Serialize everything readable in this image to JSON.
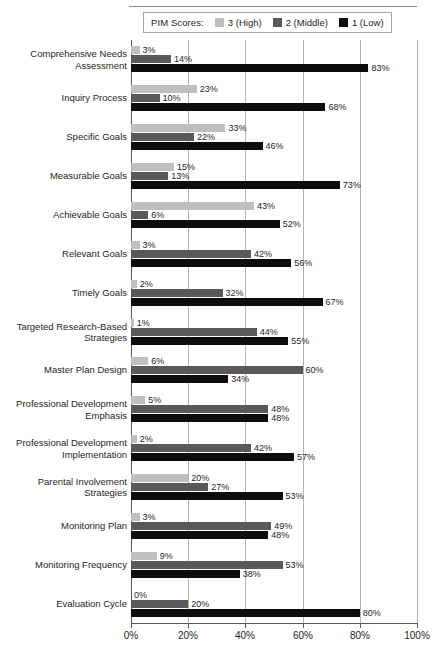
{
  "legend": {
    "title": "PIM Scores:",
    "items": [
      {
        "label": "3 (High)",
        "color": "#bfbfbf",
        "series": "3"
      },
      {
        "label": "2 (Middle)",
        "color": "#58595b",
        "series": "2"
      },
      {
        "label": "1 (Low)",
        "color": "#0d0d0d",
        "series": "1"
      }
    ]
  },
  "chart_data": {
    "type": "bar",
    "orientation": "horizontal",
    "title": "",
    "xlabel": "",
    "ylabel": "",
    "xlim": [
      0,
      100
    ],
    "xticks": [
      "0%",
      "20%",
      "40%",
      "60%",
      "80%",
      "100%"
    ],
    "xtick_values": [
      0,
      20,
      40,
      60,
      80,
      100
    ],
    "grid": true,
    "legend_position": "top",
    "value_suffix": "%",
    "categories": [
      "Comprehensive Needs\nAssessment",
      "Inquiry Process",
      "Specific Goals",
      "Measurable Goals",
      "Achievable Goals",
      "Relevant Goals",
      "Timely Goals",
      "Targeted Research-Based\nStrategies",
      "Master Plan Design",
      "Professional Development\nEmphasis",
      "Professional Development\nImplementation",
      "Parental Involvement\nStrategies",
      "Monitoring Plan",
      "Monitoring Frequency",
      "Evaluation Cycle"
    ],
    "series": [
      {
        "name": "3 (High)",
        "color": "#bfbfbf",
        "values": [
          3,
          23,
          33,
          15,
          43,
          3,
          2,
          1,
          6,
          5,
          2,
          20,
          3,
          9,
          0
        ],
        "labels": [
          "3%",
          "23%",
          "33%",
          "15%",
          "43%",
          "3%",
          "2%",
          "1%",
          "6%",
          "5%",
          "2%",
          "20%",
          "3%",
          "9%",
          "0%"
        ]
      },
      {
        "name": "2 (Middle)",
        "color": "#58595b",
        "values": [
          14,
          10,
          22,
          13,
          6,
          42,
          32,
          44,
          60,
          48,
          42,
          27,
          49,
          53,
          20
        ],
        "labels": [
          "14%",
          "10%",
          "22%",
          "13%",
          "6%",
          "42%",
          "32%",
          "44%",
          "60%",
          "48%",
          "42%",
          "27%",
          "49%",
          "53%",
          "20%"
        ]
      },
      {
        "name": "1 (Low)",
        "color": "#0d0d0d",
        "values": [
          83,
          68,
          46,
          73,
          52,
          56,
          67,
          55,
          34,
          48,
          57,
          53,
          48,
          38,
          80
        ],
        "labels": [
          "83%",
          "68%",
          "46%",
          "73%",
          "52%",
          "56%",
          "67%",
          "55%",
          "34%",
          "48%",
          "57%",
          "53%",
          "48%",
          "38%",
          "80%"
        ]
      }
    ]
  }
}
